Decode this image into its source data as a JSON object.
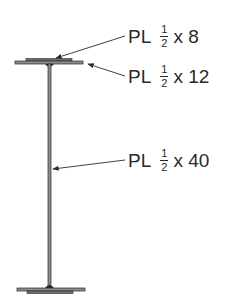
{
  "diagram": {
    "type": "plate-girder-cross-section",
    "colors": {
      "line": "#2a2a2a",
      "plate_fill": "#8c8c8c"
    },
    "labels": [
      {
        "id": "top-cover-plate",
        "prefix": "PL",
        "frac_num": "1",
        "frac_den": "2",
        "times": "x",
        "dim": "8"
      },
      {
        "id": "flange-plate",
        "prefix": "PL",
        "frac_num": "1",
        "frac_den": "2",
        "times": "x",
        "dim": "12"
      },
      {
        "id": "web-plate",
        "prefix": "PL",
        "frac_num": "1",
        "frac_den": "2",
        "times": "x",
        "dim": "40"
      }
    ]
  }
}
